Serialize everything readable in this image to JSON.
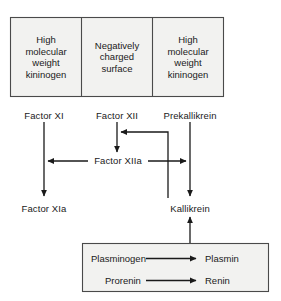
{
  "figure": {
    "name": "contact-activation-pathway-diagram",
    "type": "flow-diagram",
    "background_color": "#ffffff",
    "stroke_color": "#1a1a1a",
    "box_fill_color": "#f2f2f0"
  },
  "top_panel": {
    "name": "contact-phase-panel",
    "cells": [
      {
        "id": "cell-hmwk-left",
        "lines": [
          "High",
          "molecular",
          "weight",
          "kininogen"
        ]
      },
      {
        "id": "cell-negatively-charged-surface",
        "lines": [
          "Negatively",
          "charged",
          "surface"
        ]
      },
      {
        "id": "cell-hmwk-right",
        "lines": [
          "High",
          "molecular",
          "weight",
          "kininogen"
        ]
      }
    ]
  },
  "zymogens": [
    {
      "id": "factor-xi",
      "label": "Factor XI"
    },
    {
      "id": "factor-xii",
      "label": "Factor XII"
    },
    {
      "id": "prekallikrein",
      "label": "Prekallikrein"
    }
  ],
  "intermediates": [
    {
      "id": "factor-xiia",
      "label": "Factor XIIa"
    }
  ],
  "products": [
    {
      "id": "factor-xia",
      "label": "Factor XIa"
    },
    {
      "id": "kallikrein",
      "label": "Kallikrein"
    }
  ],
  "bottom_panel": {
    "name": "kallikrein-substrates-panel",
    "reactions": [
      {
        "id": "plasminogen-to-plasmin",
        "substrate": "Plasminogen",
        "product": "Plasmin"
      },
      {
        "id": "prorenin-to-renin",
        "substrate": "Prorenin",
        "product": "Renin"
      }
    ]
  }
}
